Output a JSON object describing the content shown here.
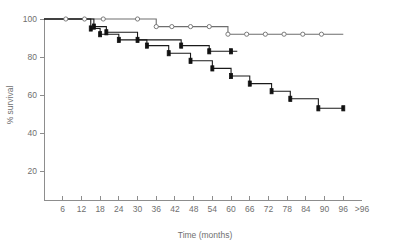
{
  "chart_data": {
    "type": "line",
    "title": "",
    "subtitle": "",
    "xlabel": "Time (months)",
    "ylabel": "% survival",
    "xlim": [
      0,
      102
    ],
    "ylim": [
      0,
      104
    ],
    "grid": false,
    "legend_position": "none",
    "x_tick_labels": [
      "6",
      "12",
      "18",
      "24",
      "30",
      "36",
      "42",
      "48",
      "54",
      "60",
      "66",
      "72",
      "78",
      "84",
      "90",
      "96",
      ">96"
    ],
    "x_tick_values": [
      6,
      12,
      18,
      24,
      30,
      36,
      42,
      48,
      54,
      60,
      66,
      72,
      78,
      84,
      90,
      96,
      102
    ],
    "y_tick_labels": [
      "20",
      "40",
      "60",
      "80",
      "100"
    ],
    "y_tick_values": [
      20,
      40,
      60,
      80,
      100
    ],
    "series": [
      {
        "name": "curve-open-circles",
        "marker": "open-circle",
        "color": "#6e6e6e",
        "points": [
          {
            "x": 0,
            "y": 100
          },
          {
            "x": 7,
            "y": 100
          },
          {
            "x": 13,
            "y": 100
          },
          {
            "x": 19,
            "y": 100
          },
          {
            "x": 24,
            "y": 100
          },
          {
            "x": 30,
            "y": 100
          },
          {
            "x": 36,
            "y": 100
          },
          {
            "x": 41,
            "y": 96
          },
          {
            "x": 47,
            "y": 96
          },
          {
            "x": 53,
            "y": 96
          },
          {
            "x": 59,
            "y": 96
          },
          {
            "x": 65,
            "y": 92
          },
          {
            "x": 71,
            "y": 92
          },
          {
            "x": 77,
            "y": 92
          },
          {
            "x": 83,
            "y": 92
          },
          {
            "x": 89,
            "y": 92
          },
          {
            "x": 96,
            "y": 92
          }
        ],
        "censor_marks": [
          7,
          13,
          19,
          30,
          36,
          41,
          47,
          53,
          59,
          65,
          71,
          77,
          83,
          89
        ],
        "steps": [
          {
            "x": 36,
            "from": 100,
            "to": 96
          },
          {
            "x": 59,
            "from": 96,
            "to": 92
          }
        ]
      },
      {
        "name": "curve-filled-middle",
        "marker": "filled-square",
        "color": "#1a1a1a",
        "points": [
          {
            "x": 0,
            "y": 100
          },
          {
            "x": 16,
            "y": 100
          },
          {
            "x": 16,
            "y": 96
          },
          {
            "x": 20,
            "y": 96
          },
          {
            "x": 20,
            "y": 93
          },
          {
            "x": 30,
            "y": 93
          },
          {
            "x": 30,
            "y": 89
          },
          {
            "x": 44,
            "y": 89
          },
          {
            "x": 44,
            "y": 86
          },
          {
            "x": 53,
            "y": 86
          },
          {
            "x": 53,
            "y": 83
          },
          {
            "x": 62,
            "y": 83
          }
        ],
        "censor_marks": [
          16,
          20,
          30,
          44,
          53,
          60
        ],
        "steps": [
          {
            "x": 16,
            "from": 100,
            "to": 96
          },
          {
            "x": 20,
            "from": 96,
            "to": 93
          },
          {
            "x": 30,
            "from": 93,
            "to": 89
          },
          {
            "x": 44,
            "from": 89,
            "to": 86
          },
          {
            "x": 53,
            "from": 86,
            "to": 83
          }
        ]
      },
      {
        "name": "curve-filled-lower",
        "marker": "filled-square",
        "color": "#1a1a1a",
        "points": [
          {
            "x": 0,
            "y": 100
          },
          {
            "x": 15,
            "y": 100
          },
          {
            "x": 15,
            "y": 95
          },
          {
            "x": 18,
            "y": 95
          },
          {
            "x": 18,
            "y": 92
          },
          {
            "x": 24,
            "y": 92
          },
          {
            "x": 24,
            "y": 89
          },
          {
            "x": 33,
            "y": 89
          },
          {
            "x": 33,
            "y": 86
          },
          {
            "x": 40,
            "y": 86
          },
          {
            "x": 40,
            "y": 82
          },
          {
            "x": 47,
            "y": 82
          },
          {
            "x": 47,
            "y": 78
          },
          {
            "x": 54,
            "y": 78
          },
          {
            "x": 54,
            "y": 74
          },
          {
            "x": 60,
            "y": 74
          },
          {
            "x": 60,
            "y": 70
          },
          {
            "x": 66,
            "y": 70
          },
          {
            "x": 66,
            "y": 66
          },
          {
            "x": 73,
            "y": 66
          },
          {
            "x": 73,
            "y": 62
          },
          {
            "x": 79,
            "y": 62
          },
          {
            "x": 79,
            "y": 58
          },
          {
            "x": 88,
            "y": 58
          },
          {
            "x": 88,
            "y": 53
          },
          {
            "x": 96,
            "y": 53
          }
        ],
        "censor_marks": [
          15,
          18,
          24,
          33,
          40,
          47,
          54,
          60,
          66,
          73,
          79,
          88,
          96
        ],
        "steps": [
          {
            "x": 15,
            "from": 100,
            "to": 95
          },
          {
            "x": 18,
            "from": 95,
            "to": 92
          },
          {
            "x": 24,
            "from": 92,
            "to": 89
          },
          {
            "x": 33,
            "from": 89,
            "to": 86
          },
          {
            "x": 40,
            "from": 86,
            "to": 82
          },
          {
            "x": 47,
            "from": 82,
            "to": 78
          },
          {
            "x": 54,
            "from": 78,
            "to": 74
          },
          {
            "x": 60,
            "from": 74,
            "to": 70
          },
          {
            "x": 66,
            "from": 70,
            "to": 66
          },
          {
            "x": 73,
            "from": 66,
            "to": 62
          },
          {
            "x": 79,
            "from": 62,
            "to": 58
          },
          {
            "x": 88,
            "from": 58,
            "to": 53
          }
        ]
      }
    ]
  }
}
